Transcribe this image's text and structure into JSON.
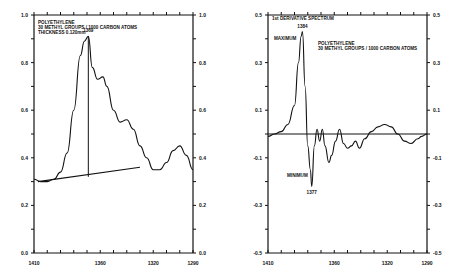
{
  "chart_data": [
    {
      "type": "line",
      "title": "POLYETHYLENE",
      "annotation_lines": [
        "POLYETHYLENE",
        "30 METHYL GROUPS / 1000 CARBON ATOMS",
        "THICKNESS 0.120mm"
      ],
      "peak_label": "1369",
      "xlabel": "",
      "ylabel": "",
      "xlim": [
        1410,
        1290
      ],
      "ylim": [
        0.0,
        1.0
      ],
      "x_ticks": [
        "1410",
        "1360",
        "1320",
        "1290"
      ],
      "y_ticks_left": [
        "1.0",
        "0.8",
        "0.6",
        "0.4",
        "0.2",
        "0.0"
      ],
      "y_ticks_right": [
        "1.0",
        "0.8",
        "0.6",
        "0.4",
        "0.2",
        "0.0"
      ],
      "x": [
        1410,
        1405,
        1400,
        1395,
        1390,
        1385,
        1380,
        1375,
        1372,
        1369,
        1366,
        1362,
        1358,
        1355,
        1350,
        1345,
        1340,
        1335,
        1330,
        1325,
        1320,
        1315,
        1310,
        1305,
        1300,
        1295,
        1290
      ],
      "values": [
        0.31,
        0.3,
        0.3,
        0.31,
        0.34,
        0.42,
        0.6,
        0.83,
        0.89,
        0.91,
        0.78,
        0.73,
        0.74,
        0.7,
        0.6,
        0.55,
        0.56,
        0.52,
        0.45,
        0.4,
        0.35,
        0.35,
        0.38,
        0.43,
        0.45,
        0.41,
        0.35
      ],
      "baseline": {
        "x": [
          1407,
          1330
        ],
        "y": [
          0.3,
          0.36
        ]
      },
      "peak_marker": {
        "x": 1369,
        "y_from": 0.32,
        "y_to": 0.91
      }
    },
    {
      "type": "line",
      "title": "1st DERIVATIVE SPECTRUM",
      "annotation_lines": [
        "POLYETHYLENE",
        "30 METHYL GROUPS / 1000 CARBON ATOMS"
      ],
      "max_label": "MAXIMUM",
      "max_value_label": "1384",
      "min_label": "MINIMUM",
      "min_value_label": "1377",
      "xlabel": "",
      "ylabel": "",
      "xlim": [
        1410,
        1290
      ],
      "ylim": [
        -0.5,
        0.5
      ],
      "x_ticks": [
        "1410",
        "1360",
        "1320",
        "1290"
      ],
      "y_ticks_left": [
        "0.5",
        "0.3",
        "0.1",
        "-0.1",
        "-0.3",
        "-0.5"
      ],
      "y_ticks_right": [
        "0.5",
        "0.3",
        "0.1",
        "-0.1",
        "-0.3",
        "-0.5"
      ],
      "x": [
        1410,
        1405,
        1400,
        1395,
        1390,
        1387,
        1385,
        1384,
        1382,
        1380,
        1378,
        1377,
        1375,
        1373,
        1371,
        1369,
        1367,
        1364,
        1362,
        1359,
        1356,
        1353,
        1350,
        1347,
        1344,
        1341,
        1337,
        1332,
        1327,
        1322,
        1317,
        1312,
        1307,
        1302,
        1297,
        1294,
        1290
      ],
      "values": [
        -0.01,
        0.0,
        0.01,
        0.04,
        0.12,
        0.3,
        0.41,
        0.43,
        0.2,
        -0.05,
        -0.15,
        -0.22,
        -0.05,
        0.02,
        -0.03,
        0.02,
        -0.05,
        -0.12,
        -0.09,
        -0.03,
        0.02,
        -0.04,
        -0.06,
        -0.05,
        -0.03,
        -0.06,
        -0.02,
        0.01,
        0.03,
        0.04,
        0.03,
        0.0,
        -0.03,
        -0.04,
        -0.02,
        -0.01,
        0.0
      ],
      "zero_line": 0.0
    }
  ]
}
